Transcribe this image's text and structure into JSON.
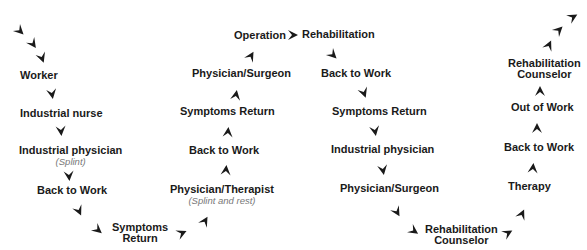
{
  "diagram": {
    "type": "flow-path",
    "nodes": [
      {
        "id": "worker",
        "label": "Worker"
      },
      {
        "id": "industrial-nurse",
        "label": "Industrial nurse"
      },
      {
        "id": "industrial-physician-1",
        "label": "Industrial physician",
        "note": "(Splint)"
      },
      {
        "id": "back-to-work-1",
        "label": "Back to Work"
      },
      {
        "id": "symptoms-return-1",
        "label": "Symptoms",
        "label2": "Return"
      },
      {
        "id": "physician-therapist",
        "label": "Physician/Therapist",
        "note": "(Splint and rest)"
      },
      {
        "id": "back-to-work-2",
        "label": "Back to Work"
      },
      {
        "id": "symptoms-return-2",
        "label": "Symptoms Return"
      },
      {
        "id": "physician-surgeon-1",
        "label": "Physician/Surgeon"
      },
      {
        "id": "operation",
        "label": "Operation"
      },
      {
        "id": "rehabilitation",
        "label": "Rehabilitation"
      },
      {
        "id": "back-to-work-3",
        "label": "Back to Work"
      },
      {
        "id": "symptoms-return-3",
        "label": "Symptoms Return"
      },
      {
        "id": "industrial-physician-2",
        "label": "Industrial physician"
      },
      {
        "id": "physician-surgeon-2",
        "label": "Physician/Surgeon"
      },
      {
        "id": "rehab-counselor-1",
        "label": "Rehabilitation",
        "label2": "Counselor"
      },
      {
        "id": "therapy",
        "label": "Therapy"
      },
      {
        "id": "back-to-work-4",
        "label": "Back to Work"
      },
      {
        "id": "out-of-work",
        "label": "Out of Work"
      },
      {
        "id": "rehab-counselor-2",
        "label": "Rehabilitation",
        "label2": "Counselor"
      }
    ],
    "edges": [
      [
        "start",
        "worker"
      ],
      [
        "worker",
        "industrial-nurse"
      ],
      [
        "industrial-nurse",
        "industrial-physician-1"
      ],
      [
        "industrial-physician-1",
        "back-to-work-1"
      ],
      [
        "back-to-work-1",
        "symptoms-return-1"
      ],
      [
        "symptoms-return-1",
        "physician-therapist"
      ],
      [
        "physician-therapist",
        "back-to-work-2"
      ],
      [
        "back-to-work-2",
        "symptoms-return-2"
      ],
      [
        "symptoms-return-2",
        "physician-surgeon-1"
      ],
      [
        "physician-surgeon-1",
        "operation"
      ],
      [
        "operation",
        "rehabilitation"
      ],
      [
        "rehabilitation",
        "back-to-work-3"
      ],
      [
        "back-to-work-3",
        "symptoms-return-3"
      ],
      [
        "symptoms-return-3",
        "industrial-physician-2"
      ],
      [
        "industrial-physician-2",
        "physician-surgeon-2"
      ],
      [
        "physician-surgeon-2",
        "rehab-counselor-1"
      ],
      [
        "rehab-counselor-1",
        "therapy"
      ],
      [
        "therapy",
        "back-to-work-4"
      ],
      [
        "back-to-work-4",
        "out-of-work"
      ],
      [
        "out-of-work",
        "rehab-counselor-2"
      ],
      [
        "rehab-counselor-2",
        "end"
      ]
    ]
  }
}
